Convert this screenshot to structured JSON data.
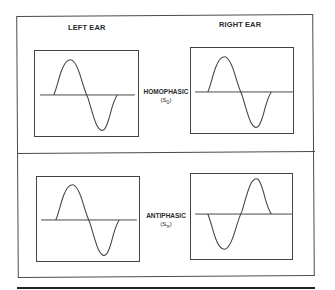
{
  "headers": {
    "left": "LEFT EAR",
    "right": "RIGHT EAR"
  },
  "conditions": [
    {
      "label": "HOMOPHASIC",
      "symbol": "(S",
      "subscript": "0",
      "close": ")",
      "left_wave": "sine",
      "right_wave": "sine"
    },
    {
      "label": "ANTIPHASIC",
      "symbol": "(S",
      "subscript": "π",
      "close": ")",
      "left_wave": "sine",
      "right_wave": "inverted-sine"
    }
  ],
  "colors": {
    "line": "#444444",
    "text": "#2a2a2a",
    "background": "#ffffff"
  }
}
